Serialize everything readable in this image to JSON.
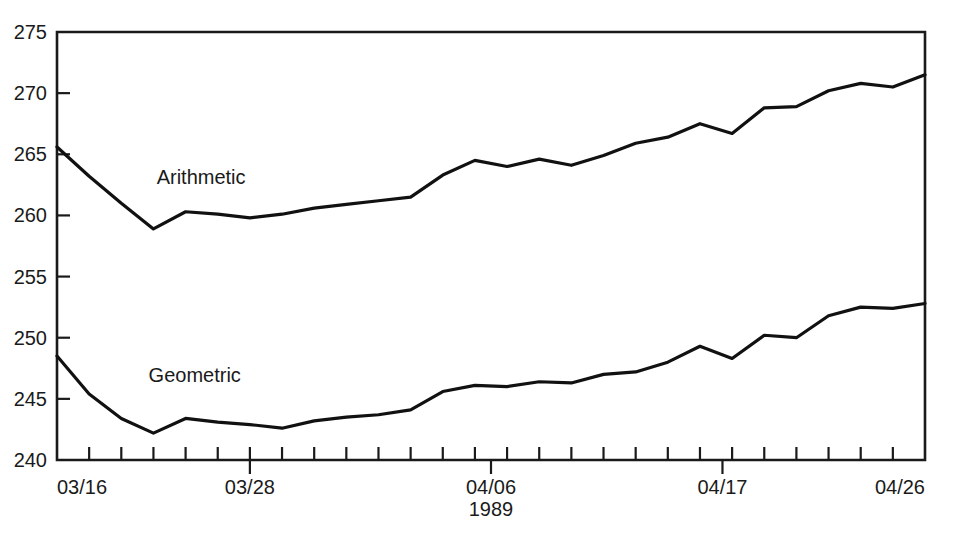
{
  "chart_data": {
    "type": "line",
    "title": "",
    "subtitle": "",
    "xlabel": "1989",
    "ylabel": "",
    "xlim": [
      0,
      27
    ],
    "ylim": [
      240,
      275
    ],
    "grid": false,
    "legend_position": "inline-annotation",
    "x_major_ticks": [
      {
        "value": 0,
        "label": "03/16"
      },
      {
        "value": 6,
        "label": "03/28"
      },
      {
        "value": 13.5,
        "label": "04/06"
      },
      {
        "value": 20.7,
        "label": "04/17"
      },
      {
        "value": 27,
        "label": "04/26"
      }
    ],
    "x_minor_tick_count": 27,
    "y_ticks": [
      240,
      245,
      250,
      255,
      260,
      265,
      270,
      275
    ],
    "y_tick_labels": [
      "240",
      "245",
      "250",
      "255",
      "260",
      "265",
      "270",
      "275"
    ],
    "x": [
      0,
      1,
      2,
      3,
      4,
      5,
      6,
      7,
      8,
      9,
      10,
      11,
      12,
      13,
      14,
      15,
      16,
      17,
      18,
      19,
      20,
      21,
      22,
      23,
      24,
      25,
      26,
      27
    ],
    "series": [
      {
        "name": "Arithmetic",
        "label": "Arithmetic",
        "color": "#111111",
        "label_x": 3.1,
        "label_y": 262.6,
        "values": [
          265.6,
          263.2,
          261.0,
          258.9,
          260.3,
          260.1,
          259.8,
          260.1,
          260.6,
          260.9,
          261.2,
          261.5,
          263.3,
          264.5,
          264.0,
          264.6,
          264.1,
          264.9,
          265.9,
          266.4,
          267.5,
          266.7,
          268.8,
          268.9,
          270.2,
          270.8,
          270.5,
          271.5
        ]
      },
      {
        "name": "Geometric",
        "label": "Geometric",
        "color": "#111111",
        "label_x": 2.85,
        "label_y": 246.4,
        "values": [
          248.5,
          245.4,
          243.4,
          242.2,
          243.4,
          243.1,
          242.9,
          242.6,
          243.2,
          243.5,
          243.7,
          244.1,
          245.6,
          246.1,
          246.0,
          246.4,
          246.3,
          247.0,
          247.2,
          248.0,
          249.3,
          248.3,
          250.2,
          250.0,
          251.8,
          252.5,
          252.4,
          252.8
        ]
      }
    ]
  },
  "axis": {
    "x_title": "1989",
    "y_min_label": "240",
    "y_max_label": "275"
  }
}
